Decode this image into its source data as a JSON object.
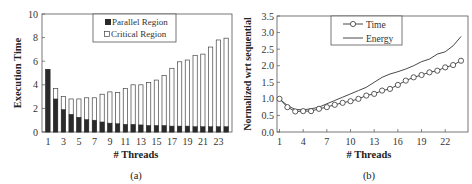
{
  "chart_data": [
    {
      "type": "bar",
      "stacked": true,
      "panel_label": "(a)",
      "title": "",
      "xlabel": "# Threads",
      "ylabel": "Execution Time",
      "ylim": [
        0,
        10
      ],
      "yticks": [
        0,
        2,
        4,
        6,
        8,
        10
      ],
      "xtick_labels": [
        "1",
        "3",
        "5",
        "7",
        "9",
        "11",
        "13",
        "15",
        "17",
        "19",
        "21",
        "23"
      ],
      "categories": [
        1,
        2,
        3,
        4,
        5,
        6,
        7,
        8,
        9,
        10,
        11,
        12,
        13,
        14,
        15,
        16,
        17,
        18,
        19,
        20,
        21,
        22,
        23,
        24
      ],
      "series": [
        {
          "name": "Parallel Region",
          "color": "#2a2a2a",
          "values": [
            5.3,
            2.8,
            1.9,
            1.5,
            1.25,
            1.05,
            1.0,
            0.85,
            0.75,
            0.7,
            0.65,
            0.65,
            0.6,
            0.55,
            0.55,
            0.55,
            0.5,
            0.5,
            0.5,
            0.45,
            0.45,
            0.45,
            0.45,
            0.45
          ]
        },
        {
          "name": "Critical Region",
          "color": "#ffffff",
          "values": [
            0.0,
            0.9,
            1.1,
            1.3,
            1.55,
            1.85,
            1.9,
            2.35,
            2.65,
            2.65,
            3.05,
            3.35,
            3.4,
            3.65,
            3.85,
            4.25,
            4.9,
            5.45,
            5.6,
            6.05,
            6.15,
            6.75,
            7.35,
            7.5
          ]
        }
      ],
      "totals": [
        5.3,
        3.7,
        3.0,
        2.8,
        2.8,
        2.9,
        2.9,
        3.2,
        3.4,
        3.35,
        3.7,
        4.0,
        4.0,
        4.2,
        4.4,
        4.8,
        5.4,
        5.95,
        6.1,
        6.5,
        6.6,
        7.2,
        7.8,
        7.95
      ],
      "legend_position": "top-right inside",
      "grid": false
    },
    {
      "type": "line",
      "panel_label": "(b)",
      "title": "",
      "xlabel": "# Threads",
      "ylabel": "Normalized wrt sequential",
      "ylim": [
        0,
        3.5
      ],
      "yticks": [
        "0.0",
        "0.5",
        "1.0",
        "1.5",
        "2.0",
        "2.5",
        "3.0",
        "3.5"
      ],
      "xtick_labels": [
        "1",
        "4",
        "7",
        "10",
        "13",
        "16",
        "19",
        "22"
      ],
      "x": [
        1,
        2,
        3,
        4,
        5,
        6,
        7,
        8,
        9,
        10,
        11,
        12,
        13,
        14,
        15,
        16,
        17,
        18,
        19,
        20,
        21,
        22,
        23,
        24
      ],
      "series": [
        {
          "name": "Time",
          "marker": "circle",
          "values": [
            1.0,
            0.75,
            0.62,
            0.63,
            0.63,
            0.7,
            0.75,
            0.82,
            0.88,
            0.93,
            1.0,
            1.1,
            1.15,
            1.25,
            1.3,
            1.42,
            1.55,
            1.65,
            1.72,
            1.8,
            1.85,
            1.95,
            2.02,
            2.15
          ]
        },
        {
          "name": "Energy",
          "marker": "none",
          "values": [
            1.0,
            0.8,
            0.68,
            0.67,
            0.7,
            0.75,
            0.85,
            0.95,
            1.05,
            1.15,
            1.25,
            1.35,
            1.5,
            1.65,
            1.75,
            1.82,
            1.9,
            2.0,
            2.12,
            2.2,
            2.35,
            2.42,
            2.6,
            2.88
          ]
        }
      ],
      "legend_position": "top-center inside",
      "grid": false
    }
  ]
}
